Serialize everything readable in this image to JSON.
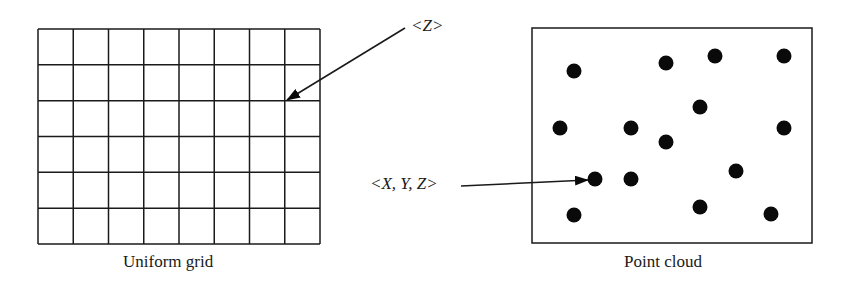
{
  "figure": {
    "panels": [
      {
        "id": "uniform-grid",
        "caption": "Uniform grid",
        "columns": 8,
        "rows": 6,
        "annotation": {
          "label": "<Z>",
          "points_to": "grid vertex"
        }
      },
      {
        "id": "point-cloud",
        "caption": "Point cloud",
        "point_count": 15,
        "annotation": {
          "label": "<X, Y, Z>",
          "points_to": "single point"
        }
      }
    ],
    "colors": {
      "line": "#1a1a1a",
      "point": "#0a0a0a",
      "background": "#ffffff"
    }
  },
  "grid": {
    "x": 38,
    "y": 29,
    "width": 282,
    "height": 215,
    "cols": 8,
    "rows": 6
  },
  "cloud": {
    "box": {
      "x": 532,
      "y": 28,
      "width": 280,
      "height": 215
    },
    "points": [
      [
        574,
        71
      ],
      [
        666,
        63
      ],
      [
        715,
        56
      ],
      [
        784,
        56
      ],
      [
        700,
        107
      ],
      [
        560,
        128
      ],
      [
        631,
        128
      ],
      [
        784,
        128
      ],
      [
        666,
        142
      ],
      [
        736,
        171
      ],
      [
        595,
        179
      ],
      [
        631,
        179
      ],
      [
        700,
        207
      ],
      [
        771,
        214
      ],
      [
        574,
        215
      ]
    ]
  }
}
